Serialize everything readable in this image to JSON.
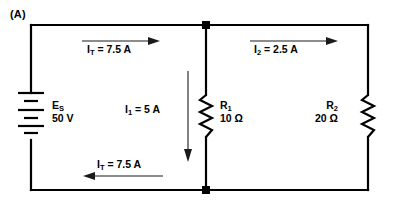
{
  "figure": {
    "panel_label": "(A)",
    "type": "parallel-resistive-circuit-schematic"
  },
  "source": {
    "symbol": "battery",
    "name": "E",
    "name_sub": "S",
    "value": "50 V"
  },
  "currents": {
    "total_top": {
      "name": "I",
      "name_sub": "T",
      "text": "= 7.5 A",
      "full": "I_T = 7.5 A",
      "direction": "right"
    },
    "branch_1": {
      "name": "I",
      "name_sub": "1",
      "text": "= 5 A",
      "full": "I_1 = 5 A",
      "direction": "down"
    },
    "branch_2": {
      "name": "I",
      "name_sub": "2",
      "text": "= 2.5 A",
      "full": "I_2 = 2.5 A",
      "direction": "right"
    },
    "total_bottom": {
      "name": "I",
      "name_sub": "T",
      "text": "= 7.5 A",
      "full": "I_T = 7.5 A",
      "direction": "left"
    }
  },
  "resistors": [
    {
      "name": "R",
      "name_sub": "1",
      "value": "10 Ω",
      "label_side": "right"
    },
    {
      "name": "R",
      "name_sub": "2",
      "value": "20 Ω",
      "label_side": "left"
    }
  ],
  "colors": {
    "wire": "#000000",
    "background": "#ffffff",
    "text": "#000000",
    "arrow": "#1a1a1a"
  }
}
